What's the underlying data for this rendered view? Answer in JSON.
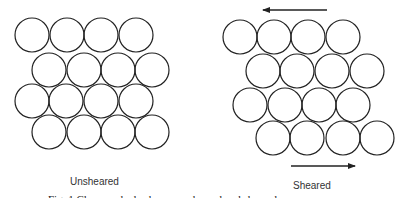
{
  "diagram": {
    "stroke_color": "#222222",
    "circle_radius": 17,
    "left_panel": {
      "label": "Unsheared",
      "rows": [
        {
          "y": 35,
          "x": [
            32,
            67,
            101,
            136
          ]
        },
        {
          "y": 70,
          "x": [
            49,
            84,
            118,
            152
          ]
        },
        {
          "y": 101,
          "x": [
            32,
            66,
            101,
            136
          ]
        },
        {
          "y": 132,
          "x": [
            49,
            84,
            118,
            152
          ]
        }
      ]
    },
    "right_panel": {
      "label": "Sheared",
      "rows": [
        {
          "y": 37,
          "x": [
            240,
            274,
            308,
            343
          ]
        },
        {
          "y": 71,
          "x": [
            263,
            297,
            332,
            367
          ]
        },
        {
          "y": 105,
          "x": [
            250,
            285,
            319,
            353
          ]
        },
        {
          "y": 138,
          "x": [
            273,
            307,
            343,
            377
          ]
        }
      ],
      "arrows": [
        {
          "name": "top-shear-arrow",
          "x1": 327,
          "y1": 10,
          "x2": 263,
          "y2": 10,
          "direction": "left"
        },
        {
          "name": "bottom-shear-arrow",
          "x1": 291,
          "y1": 166,
          "x2": 355,
          "y2": 166,
          "direction": "right"
        }
      ]
    },
    "caption": "Fig. 1   Close-packed spheres, unsheared and sheared ..."
  }
}
